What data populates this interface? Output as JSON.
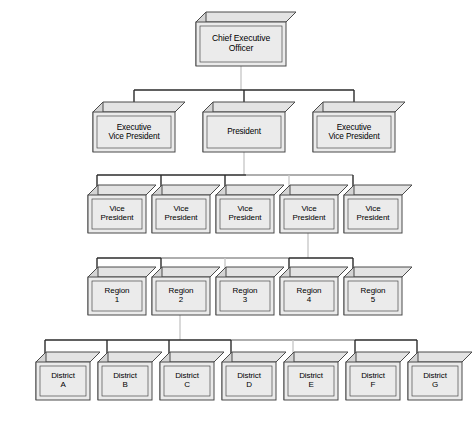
{
  "diagram": {
    "type": "org-chart",
    "background_color": "#ffffff",
    "box_face_color": "#ebebeb",
    "box_top_color": "#e3e3e3",
    "box_side_color": "#d4d4d4",
    "box_stroke_color": "#4a4a4a",
    "connector_color": "#2b2b2b",
    "connector_faded_color": "#c9c9c9",
    "depth": 10
  },
  "levels": [
    {
      "name": "executive",
      "nodes": [
        {
          "id": "ceo",
          "label": "Chief Executive\nOfficer",
          "x": 196,
          "y": 22,
          "w": 90,
          "h": 44,
          "font_size": 8.6
        }
      ]
    },
    {
      "name": "senior-management",
      "nodes": [
        {
          "id": "evp-left",
          "label": "Executive\nVice President",
          "x": 93,
          "y": 112,
          "w": 82,
          "h": 40,
          "font_size": 8.2
        },
        {
          "id": "president",
          "label": "President",
          "x": 203,
          "y": 112,
          "w": 82,
          "h": 40,
          "font_size": 8.2
        },
        {
          "id": "evp-right",
          "label": "Executive\nVice President",
          "x": 313,
          "y": 112,
          "w": 82,
          "h": 40,
          "font_size": 8.2
        }
      ]
    },
    {
      "name": "vice-presidents",
      "nodes": [
        {
          "id": "vp-1",
          "label": "Vice\nPresident",
          "x": 88,
          "y": 195,
          "w": 58,
          "h": 38,
          "font_size": 8.0
        },
        {
          "id": "vp-2",
          "label": "Vice\nPresident",
          "x": 152,
          "y": 195,
          "w": 58,
          "h": 38,
          "font_size": 8.0
        },
        {
          "id": "vp-3",
          "label": "Vice\nPresident",
          "x": 216,
          "y": 195,
          "w": 58,
          "h": 38,
          "font_size": 8.0
        },
        {
          "id": "vp-4",
          "label": "Vice\nPresident",
          "x": 280,
          "y": 195,
          "w": 58,
          "h": 38,
          "font_size": 8.0
        },
        {
          "id": "vp-5",
          "label": "Vice\nPresident",
          "x": 344,
          "y": 195,
          "w": 58,
          "h": 38,
          "font_size": 8.0
        }
      ]
    },
    {
      "name": "regions",
      "nodes": [
        {
          "id": "region-1",
          "label": "Region\n1",
          "x": 88,
          "y": 277,
          "w": 58,
          "h": 38,
          "font_size": 8.0
        },
        {
          "id": "region-2",
          "label": "Region\n2",
          "x": 152,
          "y": 277,
          "w": 58,
          "h": 38,
          "font_size": 8.0
        },
        {
          "id": "region-3",
          "label": "Region\n3",
          "x": 216,
          "y": 277,
          "w": 58,
          "h": 38,
          "font_size": 8.0
        },
        {
          "id": "region-4",
          "label": "Region\n4",
          "x": 280,
          "y": 277,
          "w": 58,
          "h": 38,
          "font_size": 8.0
        },
        {
          "id": "region-5",
          "label": "Region\n5",
          "x": 344,
          "y": 277,
          "w": 58,
          "h": 38,
          "font_size": 8.0
        }
      ]
    },
    {
      "name": "districts",
      "nodes": [
        {
          "id": "district-a",
          "label": "District\nA",
          "x": 36,
          "y": 362,
          "w": 54,
          "h": 38,
          "font_size": 8.0
        },
        {
          "id": "district-b",
          "label": "District\nB",
          "x": 98,
          "y": 362,
          "w": 54,
          "h": 38,
          "font_size": 8.0
        },
        {
          "id": "district-c",
          "label": "District\nC",
          "x": 160,
          "y": 362,
          "w": 54,
          "h": 38,
          "font_size": 8.0
        },
        {
          "id": "district-d",
          "label": "District\nD",
          "x": 222,
          "y": 362,
          "w": 54,
          "h": 38,
          "font_size": 8.0
        },
        {
          "id": "district-e",
          "label": "District\nE",
          "x": 284,
          "y": 362,
          "w": 54,
          "h": 38,
          "font_size": 8.0
        },
        {
          "id": "district-f",
          "label": "District\nF",
          "x": 346,
          "y": 362,
          "w": 54,
          "h": 38,
          "font_size": 8.0
        },
        {
          "id": "district-g",
          "label": "District\nG",
          "x": 408,
          "y": 362,
          "w": 54,
          "h": 38,
          "font_size": 8.0
        }
      ]
    }
  ],
  "connectors": {
    "ceo_to_row2": {
      "stem_x": 241,
      "stem_top": 66,
      "bus_y": 90,
      "bus_left": 134,
      "bus_right": 354,
      "drops": [
        134,
        244,
        354
      ],
      "faded_stem": true
    },
    "president_to_row3": {
      "stem_x": 244,
      "stem_top": 152,
      "bus_y": 175,
      "bus_left": 97,
      "bus_right": 353,
      "drops": [
        97,
        161,
        225,
        289,
        353
      ],
      "faded_segment": [
        246,
        353
      ]
    },
    "vp4_to_row4": {
      "stem_x": 308,
      "stem_top": 233,
      "bus_y": 258,
      "bus_left": 97,
      "bus_right": 353,
      "drops": [
        97,
        161,
        225,
        289,
        353
      ],
      "faded_segment": [
        161,
        289
      ]
    },
    "region2_to_row5": {
      "stem_x": 180,
      "stem_top": 315,
      "bus_y": 340,
      "bus_left": 45,
      "bus_right": 417,
      "drops": [
        45,
        107,
        169,
        231,
        293,
        355,
        417
      ],
      "faded_segment": [
        231,
        355
      ]
    }
  }
}
